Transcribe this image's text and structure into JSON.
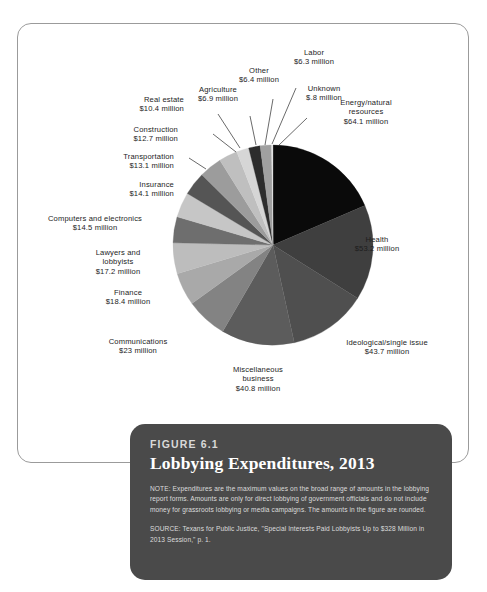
{
  "figure": {
    "number": "FIGURE 6.1",
    "title": "Lobbying Expenditures, 2013",
    "note": "NOTE: Expenditures are the maximum values on the broad range of amounts in the lobbying report forms. Amounts are only for direct lobbying of government officials and do not include money for grassroots lobbying or media campaigns. The amounts in the figure are rounded.",
    "source": "SOURCE: Texans for Public Justice, \"Special Interests Paid Lobbyists Up to $328 Million in 2013 Session,\" p. 1."
  },
  "chart_data": {
    "type": "pie",
    "title": "Lobbying Expenditures, 2013",
    "units": "millions of dollars",
    "legend": "none (direct labels with leader lines)",
    "start_angle_deg": 0,
    "direction": "clockwise",
    "categories": [
      "Energy/natural resources",
      "Health",
      "Ideological/single issue",
      "Miscellaneous business",
      "Communications",
      "Finance",
      "Lawyers and lobbyists",
      "Computers and electronics",
      "Insurance",
      "Transportation",
      "Construction",
      "Real estate",
      "Agriculture",
      "Other",
      "Labor",
      "Unknown"
    ],
    "values": [
      64.1,
      53.2,
      43.7,
      40.8,
      23,
      18.4,
      17.2,
      14.5,
      14.1,
      13.1,
      12.7,
      10.4,
      6.9,
      6.4,
      6.3,
      0.8
    ],
    "value_labels": [
      "$64.1 million",
      "$53.2 million",
      "$43.7 million",
      "$40.8 million",
      "$23 million",
      "$18.4 million",
      "$17.2 million",
      "$14.5 million",
      "$14.1 million",
      "$13.1 million",
      "$12.7 million",
      "$10.4 million",
      "$6.9 million",
      "$6.4 million",
      "$6.3 million",
      "$.8 million"
    ],
    "colors": [
      "#0a0a0a",
      "#3f3f3f",
      "#4f4f4f",
      "#5c5c5c",
      "#838383",
      "#a9a9a9",
      "#bdbdbd",
      "#6e6e6e",
      "#c6c6c6",
      "#555555",
      "#9c9c9c",
      "#bfbfbf",
      "#d6d6d6",
      "#2c2c2c",
      "#a0a0a0",
      "#e2e2e2"
    ],
    "total": 345.6
  },
  "labels": [
    {
      "id": "energy",
      "text": "Energy/natural\nresources\n$64.1 million"
    },
    {
      "id": "health",
      "text": "Health\n$53.2 million"
    },
    {
      "id": "ideological",
      "text": "Ideological/single issue\n$43.7 million"
    },
    {
      "id": "miscellaneous",
      "text": "Miscellaneous\nbusiness\n$40.8 million"
    },
    {
      "id": "communications",
      "text": "Communications\n$23 million"
    },
    {
      "id": "finance",
      "text": "Finance\n$18.4 million"
    },
    {
      "id": "lawyers",
      "text": "Lawyers and\nlobbyists\n$17.2 million"
    },
    {
      "id": "computers",
      "text": "Computers and electronics\n$14.5 million"
    },
    {
      "id": "insurance",
      "text": "Insurance\n$14.1 million"
    },
    {
      "id": "transportation",
      "text": "Transportation\n$13.1 million"
    },
    {
      "id": "construction",
      "text": "Construction\n$12.7 million"
    },
    {
      "id": "realestate",
      "text": "Real estate\n$10.4 million"
    },
    {
      "id": "agriculture",
      "text": "Agriculture\n$6.9 million"
    },
    {
      "id": "other",
      "text": "Other\n$6.4 million"
    },
    {
      "id": "labor",
      "text": "Labor\n$6.3 million"
    },
    {
      "id": "unknown",
      "text": "Unknown\n$.8 million"
    }
  ]
}
